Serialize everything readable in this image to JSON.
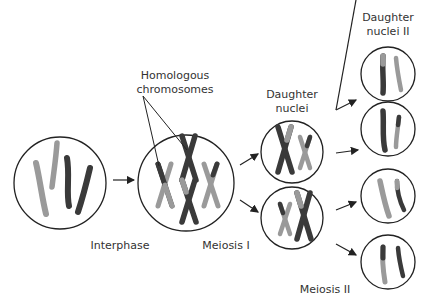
{
  "diagram": {
    "labels": {
      "homologous_line1": "Homologous",
      "homologous_line2": "chromosomes",
      "daughter_line1": "Daughter",
      "daughter_line2": "nuclei",
      "daughter2_line1": "Daughter",
      "daughter2_line2": "nuclei II",
      "interphase": "Interphase",
      "meiosis1": "Meiosis I",
      "meiosis2": "Meiosis II"
    },
    "colors": {
      "dark_chromosome": "#3a3a3a",
      "light_chromosome": "#9a9a9a",
      "outline": "#222222",
      "text": "#333333"
    }
  }
}
